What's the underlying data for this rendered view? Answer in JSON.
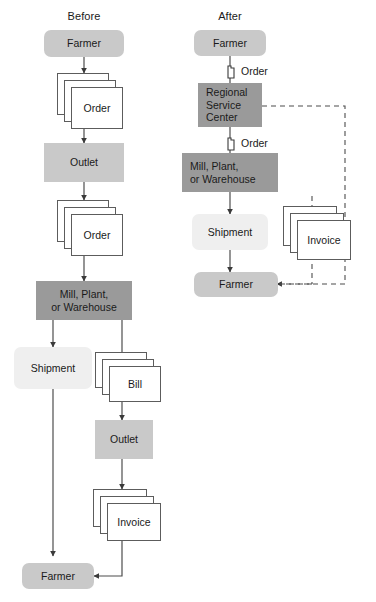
{
  "figure": {
    "columns": [
      {
        "id": "before",
        "title": "Before"
      },
      {
        "id": "after",
        "title": "After"
      }
    ],
    "colors": {
      "box_light": "#efefef",
      "box_mid": "#c9c9c9",
      "box_dark": "#9a9a9a",
      "document_fill": "#ffffff",
      "line": "#4d4d4d",
      "text": "#1a1a1a",
      "background": "#ffffff"
    }
  },
  "before": {
    "title": "Before",
    "nodes": {
      "farmer_top": "Farmer",
      "order_1": "Order",
      "outlet_1": "Outlet",
      "order_2": "Order",
      "mill": "Mill, Plant,\nor Warehouse",
      "mill_line1": "Mill, Plant,",
      "mill_line2": "or Warehouse",
      "shipment": "Shipment",
      "bill": "Bill",
      "outlet_2": "Outlet",
      "invoice": "Invoice",
      "farmer_bottom": "Farmer"
    }
  },
  "after": {
    "title": "After",
    "nodes": {
      "farmer_top": "Farmer",
      "rsc": "Regional\nService\nCenter",
      "rsc_line1": "Regional",
      "rsc_line2": "Service",
      "rsc_line3": "Center",
      "mill_line1": "Mill, Plant,",
      "mill_line2": "or Warehouse",
      "shipment": "Shipment",
      "invoice": "Invoice",
      "farmer_bottom": "Farmer"
    },
    "edge_labels": {
      "order_to_rsc": "Order",
      "order_to_mill": "Order"
    }
  }
}
